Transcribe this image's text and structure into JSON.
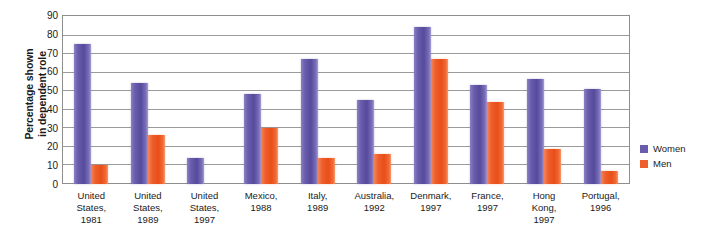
{
  "chart_data": {
    "type": "bar",
    "title": "",
    "subtitle": "",
    "xlabel": "",
    "ylabel": "Percentage shown in dependent role",
    "ylabel_lines": [
      "Percentage shown",
      "in dependent role"
    ],
    "ylim": [
      0,
      90
    ],
    "ytick_step": 10,
    "yticks": [
      90,
      80,
      70,
      60,
      50,
      40,
      30,
      20,
      10,
      0
    ],
    "grid": true,
    "grid_axis": "y",
    "legend_position": "right",
    "categories": [
      "United\nStates,\n1981",
      "United\nStates,\n1989",
      "United\nStates,\n1997",
      "Mexico,\n1988",
      "Italy,\n1989",
      "Australia,\n1992",
      "Denmark,\n1997",
      "France,\n1997",
      "Hong\nKong,\n1997",
      "Portugal,\n1996"
    ],
    "series": [
      {
        "name": "Women",
        "color": "#6a5dad",
        "values": [
          75,
          54,
          14,
          48,
          67,
          45,
          84,
          53,
          56,
          51
        ]
      },
      {
        "name": "Men",
        "color": "#ee5f2c",
        "values": [
          10,
          26,
          null,
          30,
          14,
          16,
          67,
          44,
          19,
          7
        ]
      }
    ]
  },
  "legend": {
    "items": [
      {
        "label": "Women",
        "swatch": "women-swatch"
      },
      {
        "label": "Men",
        "swatch": "men-swatch"
      }
    ]
  },
  "colors": {
    "women": "#6a5dad",
    "men": "#ee5f2c",
    "gridline": "#9a9a9a",
    "frame": "#8e8e8e",
    "text": "#1a1a1a",
    "background": "#ffffff"
  }
}
